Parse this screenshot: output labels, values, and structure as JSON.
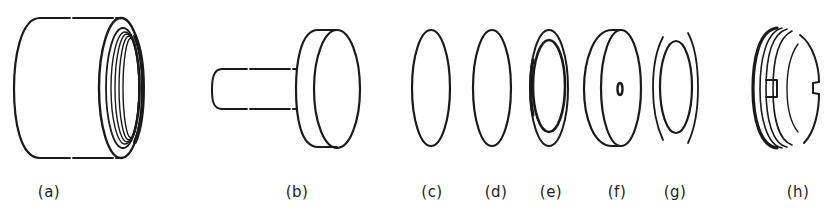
{
  "figure": {
    "type": "exploded-view technical drawing",
    "parts": [
      {
        "id": "a",
        "label": "(a)",
        "description": "threaded cylindrical housing",
        "label_x": 49
      },
      {
        "id": "b",
        "label": "(b)",
        "description": "plunger with stem and disc head",
        "label_x": 297
      },
      {
        "id": "c",
        "label": "(c)",
        "description": "thin disc",
        "label_x": 432
      },
      {
        "id": "d",
        "label": "(d)",
        "description": "thin disc",
        "label_x": 496
      },
      {
        "id": "e",
        "label": "(e)",
        "description": "ring with inner disc",
        "label_x": 551
      },
      {
        "id": "f",
        "label": "(f)",
        "description": "thick disc with central hole",
        "label_x": 617
      },
      {
        "id": "g",
        "label": "(g)",
        "description": "split washer ring",
        "label_x": 675
      },
      {
        "id": "h",
        "label": "(h)",
        "description": "threaded retaining ring with slots",
        "label_x": 798
      }
    ]
  },
  "colors": {
    "background": "#ffffff",
    "ink": "#1a1a1a"
  }
}
